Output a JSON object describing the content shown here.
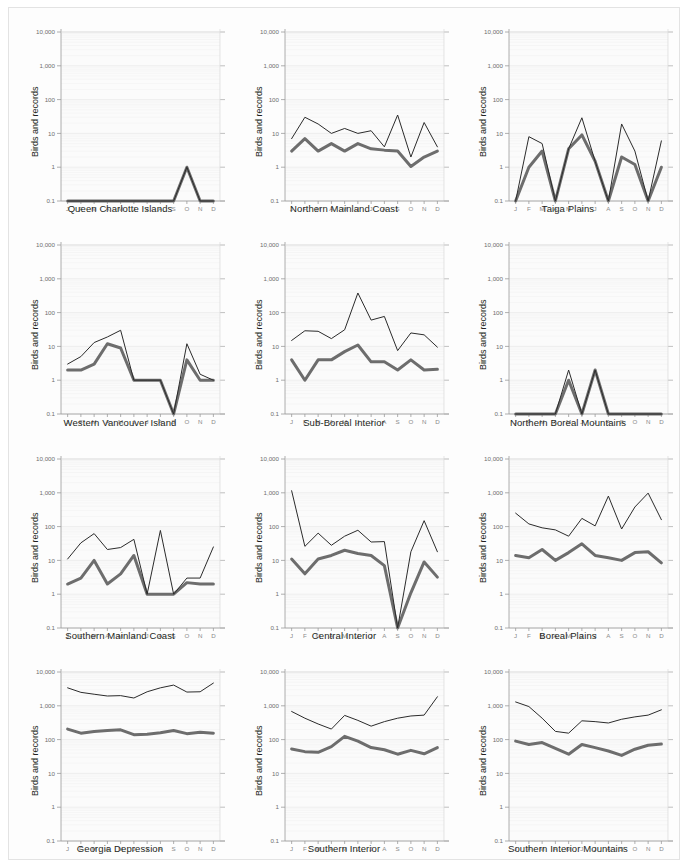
{
  "figure": {
    "y_axis_label": "Birds and records",
    "y_ticks": [
      "10,000",
      "1,000",
      "100",
      "10",
      "1",
      "0.1"
    ],
    "y_tick_values": [
      10000,
      1000,
      100,
      10,
      1,
      0.1
    ],
    "ylim": [
      0.1,
      10000
    ],
    "month_labels": [
      "J",
      "F",
      "M",
      "A",
      "M",
      "J",
      "J",
      "A",
      "S",
      "O",
      "N",
      "D"
    ],
    "series_names": [
      "records",
      "birds"
    ],
    "colors": {
      "records": "#2b2b2b",
      "birds": "#6d6d6d",
      "background": "#fbfbfb",
      "grid": "#f2f2f2",
      "axis": "#9b9b9b"
    },
    "scale": "log"
  },
  "chart_data": [
    {
      "type": "line",
      "title": "Queen Charlotte Islands",
      "xlabel": "Queen Charlotte Islands",
      "ylabel": "Birds and records",
      "ylim": [
        0.1,
        10000
      ],
      "scale": "log",
      "grid": true,
      "legend": "none",
      "categories": [
        "J",
        "F",
        "M",
        "A",
        "M",
        "J",
        "J",
        "A",
        "S",
        "O",
        "N",
        "D"
      ],
      "series": [
        {
          "name": "records",
          "values": [
            0.1,
            0.1,
            0.1,
            0.1,
            0.1,
            0.1,
            0.1,
            0.1,
            0.1,
            1,
            0.1,
            0.1
          ]
        },
        {
          "name": "birds",
          "values": [
            0.1,
            0.1,
            0.1,
            0.1,
            0.1,
            0.1,
            0.1,
            0.1,
            0.1,
            1,
            0.1,
            0.1
          ]
        }
      ]
    },
    {
      "type": "line",
      "title": "Northern Mainland Coast",
      "xlabel": "Northern Mainland Coast",
      "ylabel": "Birds and records",
      "ylim": [
        0.1,
        10000
      ],
      "scale": "log",
      "grid": true,
      "legend": "none",
      "categories": [
        "J",
        "F",
        "M",
        "A",
        "M",
        "J",
        "J",
        "A",
        "S",
        "O",
        "N",
        "D"
      ],
      "series": [
        {
          "name": "records",
          "values": [
            7,
            30,
            19,
            10,
            14,
            10,
            12,
            4,
            35,
            2,
            21,
            4
          ]
        },
        {
          "name": "birds",
          "values": [
            3,
            7,
            3,
            5,
            3,
            5,
            3.5,
            3.2,
            3,
            1.05,
            2,
            3
          ]
        }
      ]
    },
    {
      "type": "line",
      "title": "Taiga Plains",
      "xlabel": "Taiga Plains",
      "ylabel": "Birds and records",
      "ylim": [
        0.1,
        10000
      ],
      "scale": "log",
      "grid": true,
      "legend": "none",
      "categories": [
        "J",
        "F",
        "M",
        "A",
        "M",
        "J",
        "J",
        "A",
        "S",
        "O",
        "N",
        "D"
      ],
      "series": [
        {
          "name": "records",
          "values": [
            0.1,
            8,
            5,
            0.1,
            3.5,
            29,
            1.5,
            0.1,
            19,
            3,
            0.1,
            6
          ]
        },
        {
          "name": "birds",
          "values": [
            0.1,
            1,
            3,
            0.1,
            3.5,
            9,
            1.5,
            0.1,
            2,
            1.2,
            0.1,
            1
          ]
        }
      ]
    },
    {
      "type": "line",
      "title": "Western Vancouver Island",
      "xlabel": "Western Vancouver Island",
      "ylabel": "Birds and records",
      "ylim": [
        0.1,
        10000
      ],
      "scale": "log",
      "grid": true,
      "legend": "none",
      "categories": [
        "J",
        "F",
        "M",
        "A",
        "M",
        "J",
        "J",
        "A",
        "S",
        "O",
        "N",
        "D"
      ],
      "series": [
        {
          "name": "records",
          "values": [
            3,
            5,
            13,
            19,
            30,
            1,
            1,
            1,
            0.1,
            12,
            1.5,
            1
          ]
        },
        {
          "name": "birds",
          "values": [
            2,
            2,
            3,
            12,
            9,
            1,
            1,
            1,
            0.1,
            4,
            1,
            1
          ]
        }
      ]
    },
    {
      "type": "line",
      "title": "Sub-Boreal Interior",
      "xlabel": "Sub-Boreal Interior",
      "ylabel": "Birds and records",
      "ylim": [
        0.1,
        10000
      ],
      "scale": "log",
      "grid": true,
      "legend": "none",
      "categories": [
        "J",
        "F",
        "M",
        "A",
        "M",
        "J",
        "J",
        "A",
        "S",
        "O",
        "N",
        "D"
      ],
      "series": [
        {
          "name": "records",
          "values": [
            15,
            29,
            28,
            17,
            31,
            380,
            60,
            77,
            7.5,
            25,
            22,
            9.5
          ]
        },
        {
          "name": "birds",
          "values": [
            4,
            1,
            4,
            4,
            7,
            11,
            3.5,
            3.5,
            2,
            4,
            2,
            2.1
          ]
        }
      ]
    },
    {
      "type": "line",
      "title": "Northern Boreal Mountains",
      "xlabel": "Northern Boreal Mountains",
      "ylabel": "Birds and records",
      "ylim": [
        0.1,
        10000
      ],
      "scale": "log",
      "grid": true,
      "legend": "none",
      "categories": [
        "J",
        "F",
        "M",
        "A",
        "M",
        "J",
        "J",
        "A",
        "S",
        "O",
        "N",
        "D"
      ],
      "series": [
        {
          "name": "records",
          "values": [
            0.1,
            0.1,
            0.1,
            0.1,
            2,
            0.1,
            2,
            0.1,
            0.1,
            0.1,
            0.1,
            0.1
          ]
        },
        {
          "name": "birds",
          "values": [
            0.1,
            0.1,
            0.1,
            0.1,
            1,
            0.1,
            2,
            0.1,
            0.1,
            0.1,
            0.1,
            0.1
          ]
        }
      ]
    },
    {
      "type": "line",
      "title": "Southern Mainland Coast",
      "xlabel": "Southern Mainland Coast",
      "ylabel": "Birds and records",
      "ylim": [
        0.1,
        10000
      ],
      "scale": "log",
      "grid": true,
      "legend": "none",
      "categories": [
        "J",
        "F",
        "M",
        "A",
        "M",
        "J",
        "J",
        "A",
        "S",
        "O",
        "N",
        "D"
      ],
      "series": [
        {
          "name": "records",
          "values": [
            11,
            33,
            62,
            21,
            24,
            42,
            1,
            77,
            1,
            3,
            3,
            25
          ]
        },
        {
          "name": "birds",
          "values": [
            2,
            3,
            10,
            2,
            4,
            14,
            1,
            1,
            1,
            2.2,
            2,
            2
          ]
        }
      ]
    },
    {
      "type": "line",
      "title": "Central Interior",
      "xlabel": "Central Interior",
      "ylabel": "Birds and records",
      "ylim": [
        0.1,
        10000
      ],
      "scale": "log",
      "grid": true,
      "legend": "none",
      "categories": [
        "J",
        "F",
        "M",
        "A",
        "M",
        "J",
        "J",
        "A",
        "S",
        "O",
        "N",
        "D"
      ],
      "series": [
        {
          "name": "records",
          "values": [
            1150,
            26,
            64,
            28,
            52,
            78,
            35,
            36,
            0.1,
            18,
            150,
            18
          ]
        },
        {
          "name": "birds",
          "values": [
            11,
            4,
            11,
            14,
            20,
            16,
            14,
            7,
            0.1,
            1.1,
            9,
            3.2
          ]
        }
      ]
    },
    {
      "type": "line",
      "title": "Boreal Plains",
      "xlabel": "Boreal Plains",
      "ylabel": "Birds and records",
      "ylim": [
        0.1,
        10000
      ],
      "scale": "log",
      "grid": true,
      "legend": "none",
      "categories": [
        "J",
        "F",
        "M",
        "A",
        "M",
        "J",
        "J",
        "A",
        "S",
        "O",
        "N",
        "D"
      ],
      "series": [
        {
          "name": "records",
          "values": [
            250,
            120,
            92,
            80,
            52,
            175,
            105,
            800,
            85,
            380,
            980,
            160
          ]
        },
        {
          "name": "birds",
          "values": [
            14,
            12,
            21,
            10,
            17,
            31,
            14,
            12,
            10,
            17,
            18,
            8.5
          ]
        }
      ]
    },
    {
      "type": "line",
      "title": "Georgia Depression",
      "xlabel": "Georgia Depression",
      "ylabel": "Birds and records",
      "ylim": [
        0.1,
        10000
      ],
      "scale": "log",
      "grid": true,
      "legend": "none",
      "categories": [
        "J",
        "F",
        "M",
        "A",
        "M",
        "J",
        "J",
        "A",
        "S",
        "O",
        "N",
        "D"
      ],
      "series": [
        {
          "name": "records",
          "values": [
            3400,
            2500,
            2200,
            1950,
            2000,
            1700,
            2600,
            3400,
            4100,
            2550,
            2600,
            4700
          ]
        },
        {
          "name": "birds",
          "values": [
            205,
            155,
            175,
            185,
            195,
            140,
            145,
            160,
            185,
            150,
            165,
            155
          ]
        }
      ]
    },
    {
      "type": "line",
      "title": "Southern Interior",
      "xlabel": "Southern Interior",
      "ylabel": "Birds and records",
      "ylim": [
        0.1,
        10000
      ],
      "scale": "log",
      "grid": true,
      "legend": "none",
      "categories": [
        "J",
        "F",
        "M",
        "A",
        "M",
        "J",
        "J",
        "A",
        "S",
        "O",
        "N",
        "D"
      ],
      "series": [
        {
          "name": "records",
          "values": [
            680,
            430,
            290,
            205,
            520,
            370,
            250,
            340,
            430,
            500,
            530,
            1850
          ]
        },
        {
          "name": "birds",
          "values": [
            53,
            44,
            42,
            62,
            125,
            90,
            58,
            50,
            37,
            48,
            38,
            58
          ]
        }
      ]
    },
    {
      "type": "line",
      "title": "Southern Interior Mountains",
      "xlabel": "Southern Interior Mountains",
      "ylabel": "Birds and records",
      "ylim": [
        0.1,
        10000
      ],
      "scale": "log",
      "grid": true,
      "legend": "none",
      "categories": [
        "J",
        "F",
        "M",
        "A",
        "M",
        "J",
        "J",
        "A",
        "S",
        "O",
        "N",
        "D"
      ],
      "series": [
        {
          "name": "records",
          "values": [
            1300,
            950,
            430,
            175,
            155,
            360,
            340,
            310,
            400,
            470,
            530,
            760
          ]
        },
        {
          "name": "birds",
          "values": [
            90,
            72,
            82,
            55,
            37,
            72,
            58,
            46,
            34,
            52,
            68,
            74
          ]
        }
      ]
    }
  ]
}
